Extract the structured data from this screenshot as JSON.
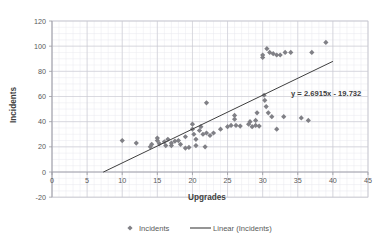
{
  "chart_data": {
    "type": "scatter",
    "title": "",
    "xlabel": "Upgrades",
    "ylabel": "Incidents",
    "xlim": [
      0,
      45
    ],
    "ylim": [
      -20,
      120
    ],
    "x_ticks": [
      0,
      5,
      10,
      15,
      20,
      25,
      30,
      35,
      40,
      45
    ],
    "y_ticks": [
      -20,
      0,
      20,
      40,
      60,
      80,
      100,
      120
    ],
    "grid": true,
    "grid_minor": true,
    "legend_position": "bottom",
    "series": [
      {
        "name": "Incidents",
        "type": "scatter",
        "marker": "diamond",
        "color": "#808086",
        "points": [
          [
            10.0,
            25.0
          ],
          [
            12.0,
            23.0
          ],
          [
            14.0,
            20.0
          ],
          [
            14.2,
            22.0
          ],
          [
            15.0,
            25.0
          ],
          [
            15.0,
            27.0
          ],
          [
            15.3,
            22.5
          ],
          [
            16.0,
            24.0
          ],
          [
            16.2,
            21.0
          ],
          [
            16.5,
            26.0
          ],
          [
            17.0,
            23.0
          ],
          [
            17.0,
            21.0
          ],
          [
            17.5,
            24.5
          ],
          [
            18.0,
            25.0
          ],
          [
            18.3,
            22.0
          ],
          [
            19.0,
            28.0
          ],
          [
            19.0,
            19.0
          ],
          [
            19.5,
            19.5
          ],
          [
            20.0,
            34.0
          ],
          [
            20.0,
            38.0
          ],
          [
            20.2,
            30.0
          ],
          [
            20.5,
            26.0
          ],
          [
            20.5,
            21.0
          ],
          [
            21.0,
            33.0
          ],
          [
            21.2,
            36.0
          ],
          [
            21.5,
            30.0
          ],
          [
            21.8,
            20.0
          ],
          [
            22.0,
            55.0
          ],
          [
            22.0,
            31.0
          ],
          [
            22.5,
            29.0
          ],
          [
            23.0,
            31.0
          ],
          [
            24.0,
            34.0
          ],
          [
            25.0,
            36.0
          ],
          [
            25.5,
            37.0
          ],
          [
            26.0,
            45.0
          ],
          [
            26.0,
            42.0
          ],
          [
            26.2,
            37.0
          ],
          [
            26.8,
            36.5
          ],
          [
            28.0,
            38.0
          ],
          [
            28.2,
            40.0
          ],
          [
            28.5,
            36.0
          ],
          [
            29.0,
            37.0
          ],
          [
            29.0,
            41.0
          ],
          [
            29.2,
            47.0
          ],
          [
            29.5,
            36.5
          ],
          [
            30.0,
            93.0
          ],
          [
            30.0,
            91.0
          ],
          [
            30.2,
            61.0
          ],
          [
            30.3,
            57.0
          ],
          [
            30.5,
            52.0
          ],
          [
            30.6,
            98.0
          ],
          [
            30.8,
            47.0
          ],
          [
            31.0,
            95.0
          ],
          [
            31.3,
            44.0
          ],
          [
            31.5,
            94.0
          ],
          [
            32.0,
            93.0
          ],
          [
            32.0,
            34.0
          ],
          [
            32.5,
            93.0
          ],
          [
            33.0,
            44.0
          ],
          [
            33.2,
            95.0
          ],
          [
            34.0,
            95.0
          ],
          [
            35.5,
            43.0
          ],
          [
            36.5,
            41.0
          ],
          [
            37.0,
            95.0
          ],
          [
            39.0,
            103.0
          ]
        ]
      },
      {
        "name": "Linear (Incidents)",
        "type": "line",
        "color": "#3f3f3f",
        "equation": "y = 2.6915x - 19.732",
        "slope": 2.6915,
        "intercept": -19.732,
        "x_start": 7.3,
        "x_end": 40.0
      }
    ],
    "annotations": [
      {
        "name": "trendline-equation",
        "text": "y = 2.6915x - 19.732",
        "x": 33.5,
        "y": 68
      }
    ],
    "legend": [
      {
        "label": "Incidents",
        "marker": "diamond",
        "color": "#808086"
      },
      {
        "label": "Linear (Incidents)",
        "marker": "line",
        "color": "#3f3f3f"
      }
    ]
  }
}
